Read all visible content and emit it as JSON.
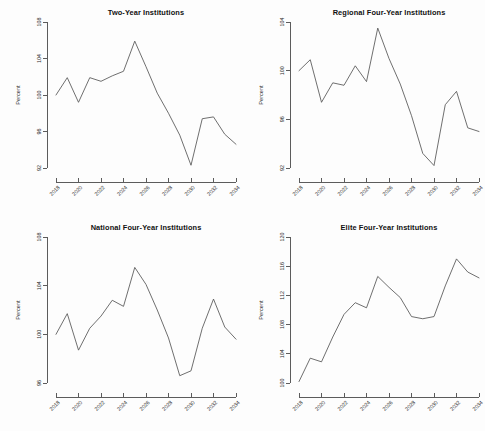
{
  "figure": {
    "background_color": "#fdfdfd",
    "line_color": "#555555",
    "axis_color": "#4a4a4a",
    "text_color": "#2b2b2b",
    "layout": "2x2 grid of line panels"
  },
  "chart_data": [
    {
      "type": "line",
      "title": "Two-Year Institutions",
      "xlabel": "",
      "ylabel": "Percent",
      "grid": false,
      "legend": "none",
      "xlim": [
        2018,
        2034
      ],
      "ylim": [
        92,
        108
      ],
      "xticks": [
        2018,
        2020,
        2022,
        2024,
        2026,
        2028,
        2030,
        2032,
        2034
      ],
      "yticks": [
        92,
        96,
        100,
        104,
        108
      ],
      "x": [
        2018,
        2019,
        2020,
        2021,
        2022,
        2023,
        2024,
        2025,
        2026,
        2027,
        2028,
        2029,
        2030,
        2031,
        2032,
        2033,
        2034
      ],
      "values": [
        100.0,
        101.9,
        99.2,
        101.9,
        101.5,
        102.1,
        102.6,
        105.9,
        103.1,
        100.2,
        98.0,
        95.6,
        92.3,
        97.4,
        97.6,
        95.7,
        94.6
      ]
    },
    {
      "type": "line",
      "title": "Regional Four-Year Institutions",
      "xlabel": "",
      "ylabel": "Percent",
      "grid": false,
      "legend": "none",
      "xlim": [
        2018,
        2034
      ],
      "ylim": [
        92,
        104
      ],
      "xticks": [
        2018,
        2020,
        2022,
        2024,
        2026,
        2028,
        2030,
        2032,
        2034
      ],
      "yticks": [
        92,
        96,
        100,
        104
      ],
      "x": [
        2018,
        2019,
        2020,
        2021,
        2022,
        2023,
        2024,
        2025,
        2026,
        2027,
        2028,
        2029,
        2030,
        2031,
        2032,
        2033,
        2034
      ],
      "values": [
        100.0,
        100.9,
        97.4,
        99.0,
        98.8,
        100.4,
        99.1,
        103.5,
        101.0,
        98.9,
        96.3,
        93.2,
        92.2,
        97.2,
        98.3,
        95.3,
        95.0
      ]
    },
    {
      "type": "line",
      "title": "National Four-Year Institutions",
      "xlabel": "",
      "ylabel": "Percent",
      "grid": false,
      "legend": "none",
      "xlim": [
        2018,
        2034
      ],
      "ylim": [
        96,
        108
      ],
      "xticks": [
        2018,
        2020,
        2022,
        2024,
        2026,
        2028,
        2030,
        2032,
        2034
      ],
      "yticks": [
        96,
        100,
        104,
        108
      ],
      "x": [
        2018,
        2019,
        2020,
        2021,
        2022,
        2023,
        2024,
        2025,
        2026,
        2027,
        2028,
        2029,
        2030,
        2031,
        2032,
        2033,
        2034
      ],
      "values": [
        100.0,
        101.7,
        98.7,
        100.5,
        101.5,
        102.8,
        102.3,
        105.5,
        104.1,
        102.0,
        99.7,
        96.6,
        97.0,
        100.5,
        102.9,
        100.6,
        99.6
      ]
    },
    {
      "type": "line",
      "title": "Elite Four-Year Institutions",
      "xlabel": "",
      "ylabel": "Percent",
      "grid": false,
      "legend": "none",
      "xlim": [
        2018,
        2034
      ],
      "ylim": [
        100,
        120
      ],
      "xticks": [
        2018,
        2020,
        2022,
        2024,
        2026,
        2028,
        2030,
        2032,
        2034
      ],
      "yticks": [
        100,
        104,
        108,
        112,
        116,
        120
      ],
      "x": [
        2018,
        2019,
        2020,
        2021,
        2022,
        2023,
        2024,
        2025,
        2026,
        2027,
        2028,
        2029,
        2030,
        2031,
        2032,
        2033,
        2034
      ],
      "values": [
        100.2,
        103.4,
        102.9,
        106.3,
        109.4,
        111.0,
        110.3,
        114.6,
        113.1,
        111.7,
        109.1,
        108.8,
        109.1,
        113.3,
        117.0,
        115.2,
        114.4
      ]
    }
  ]
}
